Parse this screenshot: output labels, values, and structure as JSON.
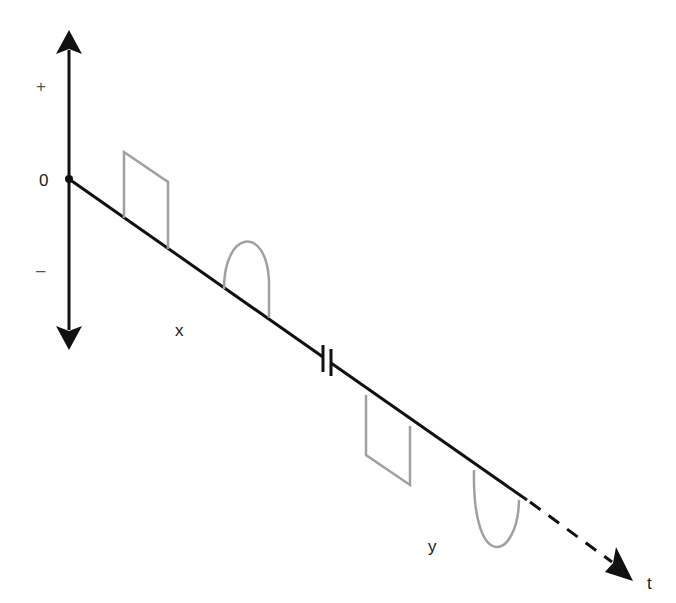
{
  "diagram": {
    "labels": {
      "plus": "+",
      "zero": "0",
      "minus": "–",
      "x": "x",
      "y": "y",
      "t": "t"
    },
    "colors": {
      "axis": "#111111",
      "signal": "#a0a0a0",
      "text": "#222222"
    },
    "elements": [
      {
        "type": "vertical-axis",
        "description": "double-headed amplitude axis"
      },
      {
        "type": "time-axis",
        "description": "diagonal time axis with break marks and dashed continuation to t"
      },
      {
        "type": "square-pulse",
        "region": "x",
        "polarity": "positive"
      },
      {
        "type": "half-sine-pulse",
        "region": "x",
        "polarity": "positive"
      },
      {
        "type": "square-pulse",
        "region": "y",
        "polarity": "negative"
      },
      {
        "type": "half-sine-pulse",
        "region": "y",
        "polarity": "negative"
      }
    ]
  }
}
